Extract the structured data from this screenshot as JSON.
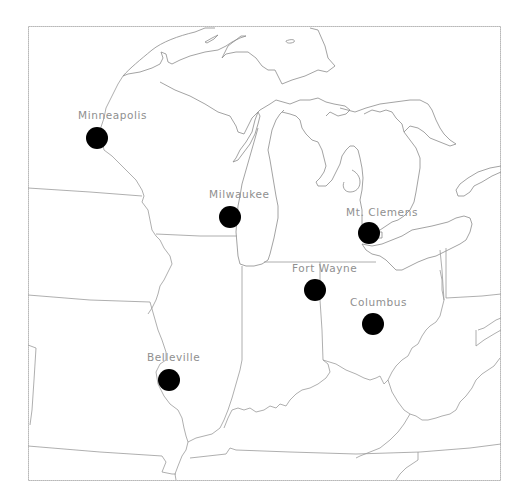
{
  "map": {
    "region": "Great Lakes / Upper Midwest",
    "frame": {
      "x": 28,
      "y": 26,
      "width": 473,
      "height": 455
    },
    "colors": {
      "background": "#ffffff",
      "outline": "#8c8c8c",
      "marker": "#000000",
      "label": "#8f8f8f"
    },
    "cities": [
      {
        "name": "Minneapolis",
        "x": 97,
        "y": 138,
        "label_x": 78,
        "label_y": 119
      },
      {
        "name": "Milwaukee",
        "x": 230,
        "y": 217,
        "label_x": 209,
        "label_y": 198
      },
      {
        "name": "Mt. Clemens",
        "x": 369,
        "y": 233,
        "label_x": 346,
        "label_y": 216
      },
      {
        "name": "Fort Wayne",
        "x": 315,
        "y": 290,
        "label_x": 292,
        "label_y": 272
      },
      {
        "name": "Columbus",
        "x": 373,
        "y": 324,
        "label_x": 350,
        "label_y": 306
      },
      {
        "name": "Belleville",
        "x": 169,
        "y": 380,
        "label_x": 147,
        "label_y": 361
      }
    ]
  }
}
